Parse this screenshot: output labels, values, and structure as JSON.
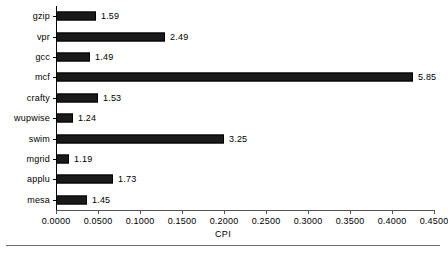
{
  "chart_data": {
    "type": "bar",
    "orientation": "horizontal",
    "title": "",
    "xlabel": "CPI",
    "ylabel": "",
    "categories": [
      "gzip",
      "vpr",
      "gcc",
      "mcf",
      "crafty",
      "wupwise",
      "swim",
      "mgrid",
      "applu",
      "mesa"
    ],
    "values": [
      0.0476,
      0.1298,
      0.0405,
      0.425,
      0.05,
      0.0202,
      0.2,
      0.0155,
      0.0679,
      0.0369
    ],
    "data_labels": [
      "1.59",
      "2.49",
      "1.49",
      "5.85",
      "1.53",
      "1.24",
      "3.25",
      "1.19",
      "1.73",
      "1.45"
    ],
    "xlim": [
      0.0,
      0.45
    ],
    "xticks": [
      0.0,
      0.05,
      0.1,
      0.15,
      0.2,
      0.25,
      0.3,
      0.35,
      0.4,
      0.45
    ],
    "xtick_labels": [
      "0.0000",
      "0.0500",
      "0.1000",
      "0.1500",
      "0.2000",
      "0.2500",
      "0.3000",
      "0.3500",
      "0.4000",
      "0.4500"
    ],
    "grid": false,
    "legend": false,
    "bar_color": "#1a1a1a",
    "axis_color": "#000000"
  }
}
